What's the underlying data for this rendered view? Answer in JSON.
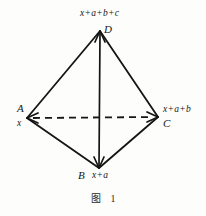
{
  "figure": {
    "caption_label": "图",
    "caption_number": "1",
    "vertices": [
      {
        "id": "D",
        "letter": "D",
        "expression": "x+a+b+c",
        "x": 100,
        "y": 31
      },
      {
        "id": "A",
        "letter": "A",
        "expression": "x",
        "x": 27,
        "y": 118
      },
      {
        "id": "C",
        "letter": "C",
        "expression": "x+a+b",
        "x": 158,
        "y": 117
      },
      {
        "id": "B",
        "letter": "B",
        "expression": "x+a",
        "x": 99,
        "y": 168
      }
    ],
    "edges": [
      {
        "from": "D",
        "to": "A",
        "style": "solid",
        "arrows": "none"
      },
      {
        "from": "D",
        "to": "C",
        "style": "solid",
        "arrows": "none"
      },
      {
        "from": "D",
        "to": "B",
        "style": "solid",
        "arrows": "both"
      },
      {
        "from": "A",
        "to": "B",
        "style": "solid",
        "arrows": "none"
      },
      {
        "from": "B",
        "to": "C",
        "style": "solid",
        "arrows": "none"
      },
      {
        "from": "A",
        "to": "C",
        "style": "dashed",
        "arrows": "both"
      }
    ],
    "colors": {
      "ink": "#151515",
      "background": "#fdfdfc"
    }
  }
}
